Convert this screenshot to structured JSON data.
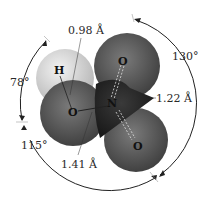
{
  "diagram": {
    "type": "space-filling molecular model",
    "molecule": "HNO3",
    "atoms": [
      {
        "symbol": "H",
        "role": "hydrogen"
      },
      {
        "symbol": "O",
        "role": "hydroxyl oxygen"
      },
      {
        "symbol": "N",
        "role": "nitrogen"
      },
      {
        "symbol": "O",
        "role": "top oxygen"
      },
      {
        "symbol": "O",
        "role": "bottom oxygen"
      }
    ],
    "labels": {
      "oh_bond": "0.98 Å",
      "no_double": "1.22 Å",
      "no_single": "1.41 Å",
      "angle_hon": "78°",
      "angle_top": "130°",
      "angle_bottom": "115°"
    },
    "colors": {
      "hydrogen": "#d8d8d8",
      "oxygen": "#5a5a5a",
      "nitrogen": "#2a2a2a",
      "arc": "#222222"
    }
  }
}
